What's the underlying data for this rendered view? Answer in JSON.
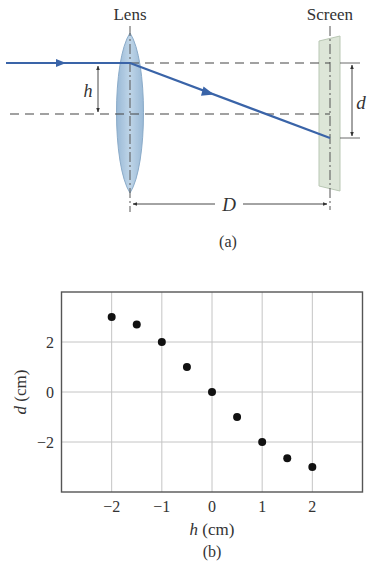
{
  "diagram": {
    "caption": "(a)",
    "lens_label": "Lens",
    "screen_label": "Screen",
    "h_label": "h",
    "d_label": "d",
    "D_label": "D",
    "colors": {
      "ray": "#3a64a8",
      "lens_fill": "#a9c6de",
      "lens_edge": "#7fa3c4",
      "screen_fill": "#dde6d8",
      "screen_edge": "#b9c7b4",
      "dash": "#444444"
    }
  },
  "chart_data": {
    "type": "scatter",
    "caption": "(b)",
    "title": "",
    "xlabel_var": "h",
    "xlabel_unit": " (cm)",
    "ylabel_var": "d",
    "ylabel_unit": " (cm)",
    "xlim": [
      -3,
      3
    ],
    "ylim": [
      -4,
      4
    ],
    "xticks": [
      -2,
      -1,
      0,
      1,
      2
    ],
    "xtick_labels": [
      "−2",
      "−1",
      "0",
      "1",
      "2"
    ],
    "yticks": [
      2,
      0,
      -2
    ],
    "ytick_labels": [
      "2",
      "0",
      "−2"
    ],
    "grid": true,
    "legend": null,
    "series": [
      {
        "name": "measured",
        "x": [
          -2,
          -1.5,
          -1,
          -0.5,
          0,
          0.5,
          1,
          1.5,
          2
        ],
        "y": [
          3.0,
          2.7,
          2.0,
          1.0,
          0.0,
          -1.0,
          -2.0,
          -2.65,
          -3.0
        ]
      }
    ]
  }
}
